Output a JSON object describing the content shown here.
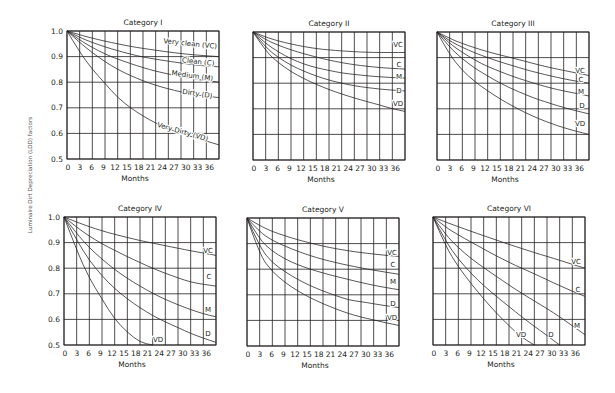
{
  "figure": {
    "ylabel": "Luminaire Dirt Depreciation (LDD) factors",
    "xlabel": "Months"
  },
  "chart_data": [
    {
      "type": "line",
      "title": "Category I",
      "xlabel": "Months",
      "ylabel": "Luminaire Dirt Depreciation (LDD) factors",
      "xlim": [
        0,
        36
      ],
      "ylim": [
        0.5,
        1.0
      ],
      "x_ticks": [
        "0",
        "3",
        "6",
        "9",
        "12",
        "15",
        "18",
        "21",
        "24",
        "27",
        "30",
        "33",
        "36"
      ],
      "y_ticks": [
        "0.5",
        "0.6",
        "0.7",
        "0.8",
        "0.9",
        "1.0"
      ],
      "grid": true,
      "x": [
        0,
        3,
        6,
        9,
        12,
        15,
        18,
        21,
        24,
        27,
        30,
        33,
        36
      ],
      "series": [
        {
          "name": "Very clean (VC)",
          "values": [
            1,
            0.985,
            0.972,
            0.96,
            0.95,
            0.94,
            0.932,
            0.925,
            0.918,
            0.912,
            0.907,
            0.903,
            0.9
          ]
        },
        {
          "name": "Clean (C)",
          "values": [
            1,
            0.975,
            0.955,
            0.938,
            0.923,
            0.91,
            0.898,
            0.89,
            0.882,
            0.875,
            0.868,
            0.863,
            0.86
          ]
        },
        {
          "name": "Medium (M)",
          "values": [
            1,
            0.965,
            0.935,
            0.91,
            0.89,
            0.873,
            0.857,
            0.843,
            0.832,
            0.822,
            0.813,
            0.806,
            0.8
          ]
        },
        {
          "name": "Dirty (D)",
          "values": [
            1,
            0.955,
            0.915,
            0.88,
            0.85,
            0.826,
            0.805,
            0.788,
            0.774,
            0.762,
            0.752,
            0.745,
            0.74
          ]
        },
        {
          "name": "Very Dirty (VD)",
          "values": [
            1,
            0.917,
            0.85,
            0.795,
            0.74,
            0.7,
            0.668,
            0.64,
            0.618,
            0.6,
            0.585,
            0.57,
            0.555
          ]
        }
      ]
    },
    {
      "type": "line",
      "title": "Category II",
      "xlabel": "Months",
      "xlim": [
        0,
        36
      ],
      "ylim": [
        0.5,
        1.0
      ],
      "x_ticks": [
        "0",
        "3",
        "6",
        "9",
        "12",
        "15",
        "18",
        "21",
        "24",
        "27",
        "30",
        "33",
        "36"
      ],
      "grid": true,
      "x": [
        0,
        3,
        6,
        9,
        12,
        15,
        18,
        21,
        24,
        27,
        30,
        33,
        36
      ],
      "series": [
        {
          "name": "VC",
          "values": [
            1,
            0.98,
            0.965,
            0.953,
            0.943,
            0.935,
            0.93,
            0.926,
            0.923,
            0.921,
            0.92,
            0.92,
            0.92
          ]
        },
        {
          "name": "C",
          "values": [
            1,
            0.97,
            0.948,
            0.93,
            0.915,
            0.902,
            0.89,
            0.88,
            0.872,
            0.866,
            0.861,
            0.858,
            0.855
          ]
        },
        {
          "name": "M",
          "values": [
            1,
            0.955,
            0.922,
            0.895,
            0.875,
            0.86,
            0.85,
            0.84,
            0.834,
            0.829,
            0.825,
            0.822,
            0.82
          ]
        },
        {
          "name": "D",
          "values": [
            1,
            0.94,
            0.9,
            0.87,
            0.847,
            0.828,
            0.812,
            0.8,
            0.79,
            0.783,
            0.777,
            0.773,
            0.77
          ]
        },
        {
          "name": "VD",
          "values": [
            1,
            0.925,
            0.88,
            0.845,
            0.818,
            0.795,
            0.775,
            0.758,
            0.742,
            0.728,
            0.715,
            0.7,
            0.69
          ]
        }
      ]
    },
    {
      "type": "line",
      "title": "Category III",
      "xlabel": "Months",
      "xlim": [
        0,
        36
      ],
      "ylim": [
        0.5,
        1.0
      ],
      "x_ticks": [
        "0",
        "3",
        "6",
        "9",
        "12",
        "15",
        "18",
        "21",
        "24",
        "27",
        "30",
        "33",
        "36"
      ],
      "grid": true,
      "x": [
        0,
        3,
        6,
        9,
        12,
        15,
        18,
        21,
        24,
        27,
        30,
        33,
        36
      ],
      "series": [
        {
          "name": "VC",
          "values": [
            1,
            0.975,
            0.955,
            0.938,
            0.923,
            0.91,
            0.898,
            0.885,
            0.872,
            0.86,
            0.85,
            0.84,
            0.83
          ]
        },
        {
          "name": "C",
          "values": [
            1,
            0.965,
            0.94,
            0.918,
            0.9,
            0.883,
            0.868,
            0.853,
            0.84,
            0.828,
            0.817,
            0.808,
            0.8
          ]
        },
        {
          "name": "M",
          "values": [
            1,
            0.955,
            0.92,
            0.89,
            0.865,
            0.845,
            0.826,
            0.81,
            0.795,
            0.781,
            0.77,
            0.76,
            0.75
          ]
        },
        {
          "name": "D",
          "values": [
            1,
            0.94,
            0.895,
            0.858,
            0.828,
            0.8,
            0.776,
            0.755,
            0.736,
            0.72,
            0.705,
            0.692,
            0.68
          ]
        },
        {
          "name": "VD",
          "values": [
            1,
            0.91,
            0.85,
            0.805,
            0.77,
            0.738,
            0.71,
            0.684,
            0.662,
            0.643,
            0.626,
            0.612,
            0.6
          ]
        }
      ]
    },
    {
      "type": "line",
      "title": "Category IV",
      "xlabel": "Months",
      "xlim": [
        0,
        36
      ],
      "ylim": [
        0.5,
        1.0
      ],
      "x_ticks": [
        "0",
        "3",
        "6",
        "9",
        "12",
        "15",
        "18",
        "21",
        "24",
        "27",
        "30",
        "33",
        "36"
      ],
      "y_ticks": [
        "0.5",
        "0.6",
        "0.7",
        "0.8",
        "0.9",
        "1.0"
      ],
      "grid": true,
      "x": [
        0,
        3,
        6,
        9,
        12,
        15,
        18,
        21,
        24,
        27,
        30,
        33,
        36
      ],
      "series": [
        {
          "name": "VC",
          "values": [
            1,
            0.98,
            0.962,
            0.946,
            0.932,
            0.92,
            0.908,
            0.898,
            0.888,
            0.878,
            0.868,
            0.859,
            0.85
          ]
        },
        {
          "name": "C",
          "values": [
            1,
            0.96,
            0.925,
            0.895,
            0.87,
            0.845,
            0.822,
            0.8,
            0.78,
            0.762,
            0.746,
            0.737,
            0.73
          ]
        },
        {
          "name": "M",
          "values": [
            1,
            0.935,
            0.88,
            0.835,
            0.795,
            0.76,
            0.73,
            0.702,
            0.678,
            0.657,
            0.638,
            0.622,
            0.61
          ]
        },
        {
          "name": "D",
          "values": [
            1,
            0.91,
            0.83,
            0.77,
            0.72,
            0.68,
            0.645,
            0.615,
            0.59,
            0.568,
            0.545,
            0.527,
            0.51
          ]
        },
        {
          "name": "VD",
          "values": [
            1,
            0.87,
            0.76,
            0.68,
            0.6,
            0.55,
            0.51,
            0.5,
            null,
            null,
            null,
            null,
            null
          ]
        }
      ]
    },
    {
      "type": "line",
      "title": "Category V",
      "xlabel": "Months",
      "xlim": [
        0,
        36
      ],
      "ylim": [
        0.5,
        1.0
      ],
      "x_ticks": [
        "0",
        "3",
        "6",
        "9",
        "12",
        "15",
        "18",
        "21",
        "24",
        "27",
        "30",
        "33",
        "36"
      ],
      "grid": true,
      "x": [
        0,
        3,
        6,
        9,
        12,
        15,
        18,
        21,
        24,
        27,
        30,
        33,
        36
      ],
      "series": [
        {
          "name": "VC",
          "values": [
            1,
            0.97,
            0.947,
            0.93,
            0.915,
            0.902,
            0.89,
            0.88,
            0.872,
            0.865,
            0.859,
            0.854,
            0.85
          ]
        },
        {
          "name": "C",
          "values": [
            1,
            0.945,
            0.912,
            0.89,
            0.87,
            0.853,
            0.838,
            0.826,
            0.815,
            0.805,
            0.796,
            0.788,
            0.78
          ]
        },
        {
          "name": "M",
          "values": [
            1,
            0.915,
            0.87,
            0.84,
            0.817,
            0.8,
            0.785,
            0.772,
            0.76,
            0.748,
            0.737,
            0.728,
            0.72
          ]
        },
        {
          "name": "D",
          "values": [
            1,
            0.885,
            0.825,
            0.79,
            0.76,
            0.735,
            0.715,
            0.697,
            0.68,
            0.673,
            0.665,
            0.657,
            0.65
          ]
        },
        {
          "name": "VD",
          "values": [
            1,
            0.855,
            0.79,
            0.748,
            0.715,
            0.688,
            0.665,
            0.645,
            0.627,
            0.613,
            0.602,
            0.59,
            0.58
          ]
        }
      ]
    },
    {
      "type": "line",
      "title": "Category VI",
      "xlabel": "Months",
      "xlim": [
        0,
        36
      ],
      "ylim": [
        0.5,
        1.0
      ],
      "x_ticks": [
        "0",
        "3",
        "6",
        "9",
        "12",
        "15",
        "18",
        "21",
        "24",
        "27",
        "30",
        "33",
        "36"
      ],
      "grid": true,
      "x": [
        0,
        3,
        6,
        9,
        12,
        15,
        18,
        21,
        24,
        27,
        30,
        33,
        36
      ],
      "series": [
        {
          "name": "VC",
          "values": [
            1,
            0.98,
            0.962,
            0.944,
            0.927,
            0.91,
            0.893,
            0.877,
            0.861,
            0.846,
            0.831,
            0.815,
            0.8
          ]
        },
        {
          "name": "C",
          "values": [
            1,
            0.96,
            0.93,
            0.902,
            0.875,
            0.848,
            0.823,
            0.8,
            0.778,
            0.755,
            0.732,
            0.71,
            0.69
          ]
        },
        {
          "name": "M",
          "values": [
            1,
            0.93,
            0.88,
            0.838,
            0.802,
            0.768,
            0.734,
            0.702,
            0.672,
            0.642,
            0.61,
            0.575,
            0.54
          ]
        },
        {
          "name": "D",
          "values": [
            1,
            0.905,
            0.835,
            0.78,
            0.732,
            0.69,
            0.65,
            0.61,
            0.573,
            0.537,
            0.5,
            null,
            null
          ]
        },
        {
          "name": "VD",
          "values": [
            1,
            0.885,
            0.805,
            0.74,
            0.68,
            0.625,
            0.575,
            0.53,
            0.5,
            null,
            null,
            null,
            null
          ]
        }
      ]
    }
  ],
  "panels_layout": [
    {
      "left": 67,
      "top": 31,
      "labels": [
        {
          "text": "Very clean (VC)",
          "x": 190,
          "y": 46,
          "rot": 6
        },
        {
          "text": "Clean (C)",
          "x": 198,
          "y": 64,
          "rot": 6
        },
        {
          "text": "Medium (M)",
          "x": 192,
          "y": 78,
          "rot": 8
        },
        {
          "text": "Dirty (D)",
          "x": 197,
          "y": 96,
          "rot": 9
        },
        {
          "text": "Very Dirty (VD)",
          "x": 182,
          "y": 134,
          "rot": 16
        }
      ]
    },
    {
      "left": 253,
      "top": 32,
      "labels": [
        {
          "text": "VC",
          "x": 398,
          "y": 47,
          "rot": 0
        },
        {
          "text": "C",
          "x": 399,
          "y": 67,
          "rot": 0
        },
        {
          "text": "M",
          "x": 399,
          "y": 79,
          "rot": 0
        },
        {
          "text": "D",
          "x": 399,
          "y": 93,
          "rot": 0
        },
        {
          "text": "VD",
          "x": 398,
          "y": 106,
          "rot": 0
        }
      ]
    },
    {
      "left": 437,
      "top": 32,
      "labels": [
        {
          "text": "VC",
          "x": 580,
          "y": 73,
          "rot": 0
        },
        {
          "text": "C",
          "x": 581,
          "y": 82,
          "rot": 0
        },
        {
          "text": "M",
          "x": 581,
          "y": 94,
          "rot": 0
        },
        {
          "text": "D",
          "x": 582,
          "y": 108,
          "rot": 0
        },
        {
          "text": "VD",
          "x": 580,
          "y": 126,
          "rot": 0
        }
      ]
    },
    {
      "left": 64,
      "top": 217,
      "labels": [
        {
          "text": "VC",
          "x": 208,
          "y": 253,
          "rot": 0
        },
        {
          "text": "C",
          "x": 209,
          "y": 279,
          "rot": 0
        },
        {
          "text": "M",
          "x": 208,
          "y": 312,
          "rot": 0
        },
        {
          "text": "D",
          "x": 208,
          "y": 336,
          "rot": 0
        },
        {
          "text": "VD",
          "x": 158,
          "y": 342,
          "rot": 0
        }
      ]
    },
    {
      "left": 247,
      "top": 218,
      "labels": [
        {
          "text": "VC",
          "x": 392,
          "y": 255,
          "rot": 0
        },
        {
          "text": "C",
          "x": 393,
          "y": 267,
          "rot": 0
        },
        {
          "text": "M",
          "x": 393,
          "y": 284,
          "rot": 0
        },
        {
          "text": "D",
          "x": 393,
          "y": 306,
          "rot": 0
        },
        {
          "text": "VD",
          "x": 392,
          "y": 320,
          "rot": 0
        }
      ]
    },
    {
      "left": 433,
      "top": 217,
      "labels": [
        {
          "text": "VC",
          "x": 576,
          "y": 264,
          "rot": 0
        },
        {
          "text": "C",
          "x": 578,
          "y": 292,
          "rot": 0
        },
        {
          "text": "M",
          "x": 577,
          "y": 328,
          "rot": 0
        },
        {
          "text": "D",
          "x": 551,
          "y": 337,
          "rot": 0
        },
        {
          "text": "VD",
          "x": 521,
          "y": 337,
          "rot": 0
        }
      ]
    }
  ]
}
